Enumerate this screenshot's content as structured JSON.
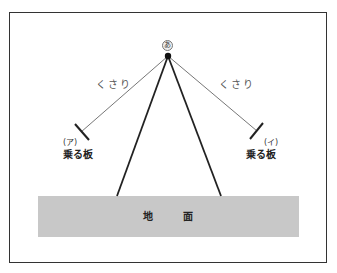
{
  "diagram": {
    "pivot_label": "あ",
    "chains": [
      {
        "label": "くさり",
        "side": "left"
      },
      {
        "label": "くさり",
        "side": "right"
      }
    ],
    "seats": [
      {
        "mark": "(ア)",
        "label": "乗る板",
        "side": "left"
      },
      {
        "mark": "(イ)",
        "label": "乗る板",
        "side": "right"
      }
    ],
    "ground": {
      "chars": [
        "地",
        "面"
      ],
      "color": "#c8c8c8"
    },
    "colors": {
      "line": "#333333",
      "chain": "#777777",
      "frame": "#333333"
    }
  }
}
